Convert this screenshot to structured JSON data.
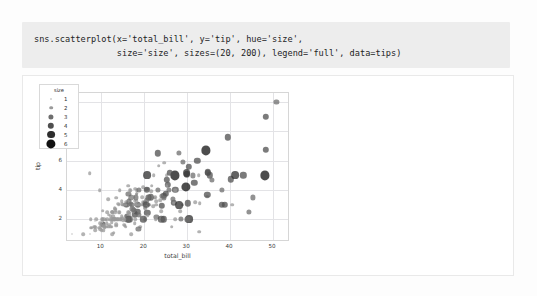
{
  "notebook": {
    "code_cell": {
      "line1": "sns.scatterplot(x='total_bill', y='tip', hue='size',",
      "line2": "                size='size', sizes=(20, 200), legend='full', data=tips)"
    }
  },
  "chart_data": {
    "type": "scatter",
    "title": "",
    "xlabel": "total_bill",
    "ylabel": "tip",
    "xlim": [
      2.0,
      53.5
    ],
    "ylim": [
      0.6,
      10.6
    ],
    "xticks": [
      10,
      20,
      30,
      40,
      50
    ],
    "yticks": [
      2,
      4,
      6,
      8,
      10
    ],
    "grid": true,
    "legend": {
      "title": "size",
      "position": "upper left",
      "entries": [
        {
          "label": "1",
          "marker_px": 2.0,
          "color": "#cfcfcf"
        },
        {
          "label": "2",
          "marker_px": 3.6,
          "color": "#9a9a9a"
        },
        {
          "label": "3",
          "marker_px": 5.2,
          "color": "#6e6e6e"
        },
        {
          "label": "4",
          "marker_px": 6.4,
          "color": "#4f4f4f"
        },
        {
          "label": "5",
          "marker_px": 7.8,
          "color": "#2e2e2e"
        },
        {
          "label": "6",
          "marker_px": 9.2,
          "color": "#111111"
        }
      ]
    },
    "hue_variable": "size",
    "size_variable": "size",
    "size_range": [
      20,
      200
    ],
    "marker_alpha": 0.75,
    "points": [
      [
        16.99,
        1.01,
        2
      ],
      [
        10.34,
        1.66,
        3
      ],
      [
        21.01,
        3.5,
        3
      ],
      [
        23.68,
        3.31,
        2
      ],
      [
        24.59,
        3.61,
        4
      ],
      [
        25.29,
        4.71,
        4
      ],
      [
        8.77,
        2.0,
        2
      ],
      [
        26.88,
        3.12,
        4
      ],
      [
        15.04,
        1.96,
        2
      ],
      [
        14.78,
        3.23,
        2
      ],
      [
        10.27,
        1.71,
        2
      ],
      [
        35.26,
        5.0,
        4
      ],
      [
        15.42,
        1.57,
        2
      ],
      [
        18.43,
        3.0,
        4
      ],
      [
        14.83,
        3.02,
        2
      ],
      [
        21.58,
        3.92,
        2
      ],
      [
        10.33,
        1.67,
        3
      ],
      [
        16.29,
        3.71,
        3
      ],
      [
        16.97,
        3.5,
        3
      ],
      [
        20.65,
        3.35,
        3
      ],
      [
        17.92,
        4.08,
        2
      ],
      [
        20.29,
        2.75,
        2
      ],
      [
        15.77,
        2.23,
        2
      ],
      [
        39.42,
        7.58,
        4
      ],
      [
        19.82,
        3.18,
        2
      ],
      [
        17.81,
        2.34,
        4
      ],
      [
        13.37,
        2.0,
        2
      ],
      [
        12.69,
        2.0,
        2
      ],
      [
        21.7,
        4.3,
        2
      ],
      [
        19.65,
        3.0,
        2
      ],
      [
        9.55,
        1.45,
        2
      ],
      [
        18.35,
        2.5,
        4
      ],
      [
        15.06,
        3.0,
        2
      ],
      [
        20.69,
        2.45,
        4
      ],
      [
        17.78,
        3.27,
        2
      ],
      [
        24.06,
        3.6,
        3
      ],
      [
        16.31,
        2.0,
        3
      ],
      [
        16.93,
        3.07,
        3
      ],
      [
        18.69,
        2.31,
        3
      ],
      [
        31.27,
        5.0,
        3
      ],
      [
        16.04,
        2.24,
        3
      ],
      [
        17.46,
        2.54,
        2
      ],
      [
        13.94,
        3.06,
        2
      ],
      [
        9.68,
        1.32,
        2
      ],
      [
        30.4,
        5.6,
        4
      ],
      [
        18.29,
        3.0,
        2
      ],
      [
        22.23,
        5.0,
        2
      ],
      [
        32.4,
        6.0,
        4
      ],
      [
        28.55,
        2.05,
        3
      ],
      [
        18.04,
        3.0,
        2
      ],
      [
        12.54,
        2.5,
        2
      ],
      [
        10.29,
        2.6,
        2
      ],
      [
        34.81,
        5.2,
        4
      ],
      [
        9.94,
        1.56,
        2
      ],
      [
        25.56,
        4.34,
        4
      ],
      [
        19.49,
        3.51,
        2
      ],
      [
        38.01,
        3.0,
        4
      ],
      [
        26.41,
        1.5,
        2
      ],
      [
        11.24,
        1.76,
        2
      ],
      [
        48.27,
        6.73,
        4
      ],
      [
        20.29,
        3.21,
        2
      ],
      [
        13.81,
        2.0,
        2
      ],
      [
        11.02,
        1.98,
        2
      ],
      [
        18.29,
        3.76,
        2
      ],
      [
        17.59,
        2.64,
        3
      ],
      [
        20.08,
        3.15,
        3
      ],
      [
        16.45,
        2.47,
        2
      ],
      [
        3.07,
        1.0,
        1
      ],
      [
        20.23,
        2.01,
        2
      ],
      [
        15.01,
        2.09,
        2
      ],
      [
        12.02,
        1.97,
        2
      ],
      [
        17.07,
        3.0,
        3
      ],
      [
        26.86,
        3.14,
        2
      ],
      [
        25.28,
        5.0,
        2
      ],
      [
        14.73,
        2.2,
        2
      ],
      [
        10.51,
        1.25,
        2
      ],
      [
        17.92,
        3.08,
        2
      ],
      [
        27.2,
        4.0,
        4
      ],
      [
        22.76,
        3.0,
        2
      ],
      [
        17.29,
        2.71,
        2
      ],
      [
        19.44,
        3.0,
        2
      ],
      [
        16.66,
        3.4,
        2
      ],
      [
        10.07,
        1.83,
        1
      ],
      [
        32.68,
        5.0,
        2
      ],
      [
        15.98,
        2.03,
        2
      ],
      [
        34.83,
        5.17,
        4
      ],
      [
        13.03,
        2.0,
        2
      ],
      [
        18.28,
        4.0,
        2
      ],
      [
        24.71,
        5.85,
        2
      ],
      [
        21.16,
        3.0,
        2
      ],
      [
        28.97,
        3.0,
        2
      ],
      [
        22.49,
        3.5,
        2
      ],
      [
        5.75,
        1.0,
        2
      ],
      [
        16.32,
        4.3,
        2
      ],
      [
        22.75,
        3.25,
        2
      ],
      [
        40.17,
        4.73,
        4
      ],
      [
        27.28,
        4.0,
        2
      ],
      [
        12.03,
        1.5,
        2
      ],
      [
        21.01,
        3.0,
        2
      ],
      [
        12.46,
        1.5,
        2
      ],
      [
        11.35,
        2.5,
        2
      ],
      [
        15.38,
        3.0,
        2
      ],
      [
        44.3,
        2.5,
        3
      ],
      [
        22.42,
        3.48,
        2
      ],
      [
        20.92,
        4.08,
        2
      ],
      [
        15.36,
        1.64,
        2
      ],
      [
        20.49,
        4.06,
        2
      ],
      [
        25.21,
        4.29,
        2
      ],
      [
        18.24,
        3.76,
        2
      ],
      [
        14.31,
        4.0,
        2
      ],
      [
        14.0,
        3.0,
        2
      ],
      [
        7.25,
        1.0,
        1
      ],
      [
        38.07,
        4.0,
        3
      ],
      [
        23.95,
        2.55,
        2
      ],
      [
        25.71,
        4.0,
        3
      ],
      [
        17.31,
        3.5,
        2
      ],
      [
        29.93,
        5.07,
        4
      ],
      [
        10.65,
        1.5,
        2
      ],
      [
        12.43,
        1.8,
        2
      ],
      [
        24.08,
        2.92,
        4
      ],
      [
        11.69,
        2.31,
        2
      ],
      [
        13.42,
        1.68,
        2
      ],
      [
        14.26,
        2.5,
        2
      ],
      [
        15.95,
        2.0,
        2
      ],
      [
        12.48,
        2.52,
        2
      ],
      [
        29.8,
        4.2,
        6
      ],
      [
        8.52,
        1.48,
        2
      ],
      [
        14.52,
        2.0,
        2
      ],
      [
        11.38,
        2.0,
        2
      ],
      [
        22.82,
        2.18,
        3
      ],
      [
        19.08,
        1.5,
        2
      ],
      [
        20.27,
        2.83,
        2
      ],
      [
        11.17,
        1.5,
        2
      ],
      [
        12.26,
        2.0,
        2
      ],
      [
        18.26,
        3.25,
        2
      ],
      [
        8.51,
        1.25,
        2
      ],
      [
        10.33,
        2.0,
        2
      ],
      [
        14.15,
        2.0,
        2
      ],
      [
        16.0,
        2.0,
        3
      ],
      [
        13.16,
        2.75,
        2
      ],
      [
        17.47,
        3.5,
        2
      ],
      [
        34.3,
        6.7,
        6
      ],
      [
        41.19,
        5.0,
        5
      ],
      [
        27.05,
        5.0,
        6
      ],
      [
        16.43,
        2.3,
        2
      ],
      [
        8.35,
        1.5,
        2
      ],
      [
        18.64,
        1.36,
        3
      ],
      [
        11.87,
        1.63,
        2
      ],
      [
        9.78,
        1.73,
        2
      ],
      [
        7.51,
        2.0,
        2
      ],
      [
        14.07,
        2.5,
        2
      ],
      [
        13.13,
        2.0,
        2
      ],
      [
        17.26,
        2.74,
        3
      ],
      [
        24.55,
        2.0,
        4
      ],
      [
        19.77,
        2.0,
        4
      ],
      [
        29.85,
        5.14,
        5
      ],
      [
        48.17,
        5.0,
        6
      ],
      [
        25.0,
        3.75,
        4
      ],
      [
        13.39,
        2.61,
        2
      ],
      [
        16.49,
        2.0,
        4
      ],
      [
        21.5,
        3.5,
        4
      ],
      [
        12.66,
        2.5,
        2
      ],
      [
        16.21,
        2.0,
        3
      ],
      [
        13.81,
        2.0,
        2
      ],
      [
        17.51,
        3.0,
        2
      ],
      [
        24.52,
        3.48,
        3
      ],
      [
        20.76,
        2.24,
        2
      ],
      [
        31.71,
        4.5,
        4
      ],
      [
        10.59,
        1.61,
        2
      ],
      [
        10.63,
        2.0,
        2
      ],
      [
        50.81,
        10.0,
        3
      ],
      [
        15.81,
        3.16,
        2
      ],
      [
        7.25,
        5.15,
        2
      ],
      [
        31.85,
        3.18,
        2
      ],
      [
        16.82,
        4.0,
        2
      ],
      [
        32.9,
        3.11,
        2
      ],
      [
        17.89,
        2.0,
        2
      ],
      [
        14.48,
        2.0,
        2
      ],
      [
        9.6,
        4.0,
        2
      ],
      [
        34.63,
        3.55,
        2
      ],
      [
        34.65,
        3.68,
        4
      ],
      [
        23.33,
        5.65,
        2
      ],
      [
        45.35,
        3.5,
        3
      ],
      [
        23.17,
        6.5,
        4
      ],
      [
        40.55,
        3.0,
        2
      ],
      [
        20.69,
        5.0,
        5
      ],
      [
        20.9,
        3.5,
        3
      ],
      [
        30.46,
        2.0,
        5
      ],
      [
        18.15,
        3.5,
        3
      ],
      [
        23.1,
        4.0,
        3
      ],
      [
        15.69,
        1.5,
        2
      ],
      [
        19.81,
        4.19,
        2
      ],
      [
        28.44,
        2.56,
        2
      ],
      [
        15.48,
        2.02,
        2
      ],
      [
        16.58,
        4.0,
        2
      ],
      [
        7.56,
        1.44,
        2
      ],
      [
        10.34,
        2.0,
        2
      ],
      [
        43.11,
        5.0,
        4
      ],
      [
        13.0,
        2.0,
        2
      ],
      [
        13.51,
        2.0,
        2
      ],
      [
        18.71,
        4.0,
        3
      ],
      [
        12.74,
        2.01,
        2
      ],
      [
        13.0,
        2.0,
        2
      ],
      [
        16.4,
        2.5,
        2
      ],
      [
        20.53,
        4.0,
        4
      ],
      [
        16.47,
        3.23,
        3
      ],
      [
        26.59,
        3.41,
        3
      ],
      [
        38.73,
        3.0,
        4
      ],
      [
        24.27,
        2.03,
        2
      ],
      [
        12.76,
        2.23,
        2
      ],
      [
        30.06,
        2.0,
        3
      ],
      [
        25.89,
        5.16,
        4
      ],
      [
        48.33,
        9.0,
        4
      ],
      [
        13.27,
        2.5,
        2
      ],
      [
        28.17,
        6.5,
        3
      ],
      [
        12.9,
        1.1,
        2
      ],
      [
        28.15,
        3.0,
        5
      ],
      [
        11.59,
        1.5,
        2
      ],
      [
        7.74,
        1.44,
        2
      ],
      [
        30.14,
        3.09,
        4
      ],
      [
        12.16,
        2.2,
        2
      ],
      [
        13.42,
        3.48,
        2
      ],
      [
        8.58,
        1.92,
        1
      ],
      [
        15.98,
        3.0,
        3
      ],
      [
        13.42,
        1.58,
        2
      ],
      [
        16.27,
        2.5,
        2
      ],
      [
        10.09,
        2.0,
        2
      ],
      [
        20.45,
        3.0,
        4
      ],
      [
        13.28,
        2.72,
        2
      ],
      [
        22.12,
        2.88,
        2
      ],
      [
        24.01,
        2.0,
        4
      ],
      [
        15.69,
        3.0,
        3
      ],
      [
        11.61,
        3.39,
        2
      ],
      [
        10.77,
        1.47,
        2
      ],
      [
        15.53,
        3.0,
        2
      ],
      [
        10.07,
        1.25,
        2
      ],
      [
        12.6,
        1.0,
        2
      ],
      [
        32.83,
        1.17,
        2
      ],
      [
        35.83,
        4.67,
        3
      ],
      [
        29.03,
        5.92,
        3
      ],
      [
        27.18,
        2.0,
        2
      ],
      [
        22.67,
        2.0,
        2
      ],
      [
        17.82,
        1.75,
        2
      ],
      [
        18.78,
        3.0,
        2
      ]
    ]
  }
}
